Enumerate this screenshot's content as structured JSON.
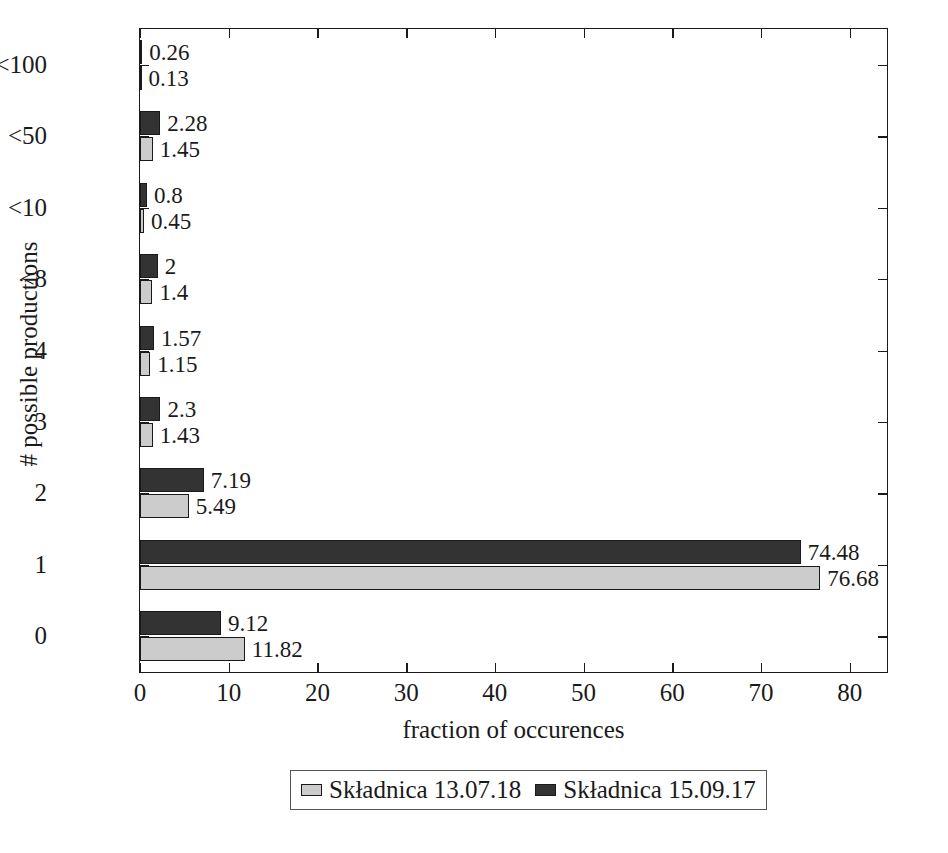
{
  "chart_data": {
    "type": "bar",
    "orientation": "horizontal",
    "title": "",
    "xlabel": "fraction of occurences",
    "ylabel": "# possible productions",
    "categories": [
      "<100",
      "<50",
      "<10",
      "<8",
      "4",
      "3",
      "2",
      "1",
      "0"
    ],
    "series": [
      {
        "name": "Składnica 15.09.17",
        "color": "#333333",
        "values": [
          0.26,
          2.28,
          0.8,
          2,
          1.57,
          2.3,
          7.19,
          74.48,
          9.12
        ],
        "labels": [
          "0.26",
          "2.28",
          "0.8",
          "2",
          "1.57",
          "2.3",
          "7.19",
          "74.48",
          "9.12"
        ]
      },
      {
        "name": "Składnica 13.07.18",
        "color": "#cccccc",
        "values": [
          0.13,
          1.45,
          0.45,
          1.4,
          1.15,
          1.43,
          5.49,
          76.68,
          11.82
        ],
        "labels": [
          "0.13",
          "1.45",
          "0.45",
          "1.4",
          "1.15",
          "1.43",
          "5.49",
          "76.68",
          "11.82"
        ]
      }
    ],
    "xticks": [
      0,
      10,
      20,
      30,
      40,
      50,
      60,
      70,
      80
    ],
    "xtick_labels": [
      "0",
      "10",
      "20",
      "30",
      "40",
      "50",
      "60",
      "70",
      "80"
    ],
    "xlim": [
      0,
      84.2
    ],
    "ylim_categories": 9,
    "grid": false,
    "legend": {
      "position": "below-center",
      "entries": [
        {
          "label": "Składnica 13.07.18",
          "color": "#cccccc"
        },
        {
          "label": "Składnica 15.09.17",
          "color": "#333333"
        }
      ]
    }
  }
}
